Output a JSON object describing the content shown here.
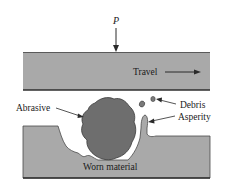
{
  "figure": {
    "colors": {
      "background": "#ffffff",
      "plate_fill": "#a9a9a9",
      "plate_edge": "#3a3a3a",
      "abrasive_fill": "#6e6e6e",
      "text": "#1a1a1a"
    },
    "labels": {
      "load": "P",
      "travel": "Travel",
      "abrasive": "Abrasive",
      "debris": "Debris",
      "asperity": "Asperity",
      "worn_material": "Worn material"
    },
    "components": [
      {
        "id": "upper-surface",
        "description": "Upper moving body under load P, travelling to the right"
      },
      {
        "id": "abrasive-particle",
        "description": "Hard abrasive particle trapped between surfaces"
      },
      {
        "id": "debris",
        "description": "Two small loose wear debris particles"
      },
      {
        "id": "asperity",
        "description": "Raised asperity on lower surface"
      },
      {
        "id": "lower-surface",
        "description": "Lower body with groove of worn material"
      }
    ]
  }
}
